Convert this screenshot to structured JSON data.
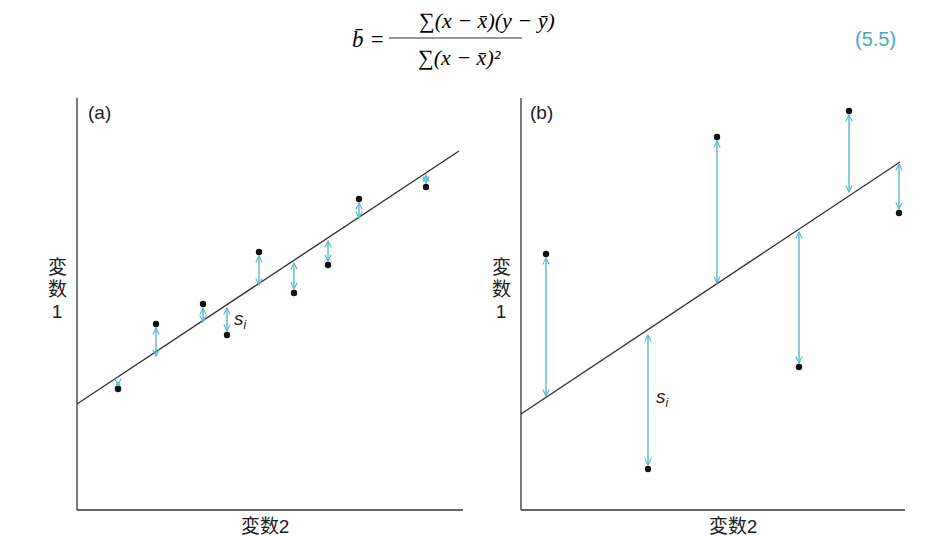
{
  "formula": {
    "lhs": "b̄ =",
    "numerator": "∑(x − x̄)(y − ȳ)",
    "denominator": "∑(x − x̄)²",
    "equation_number": "(5.5)",
    "equation_number_color": "#4aa8c0"
  },
  "colors": {
    "arrow": "#5bb7cc",
    "line": "#333333",
    "point": "#111111",
    "axis": "#333333"
  },
  "chart_data": [
    {
      "type": "scatter",
      "title": "(a)",
      "xlabel": "変数2",
      "ylabel": "変数1",
      "grid": false,
      "residual_label": "si",
      "note": "Small residuals: points lie close to the regression line",
      "points_px": [
        {
          "x": 118,
          "y": 389,
          "line_y": 381
        },
        {
          "x": 156,
          "y": 324,
          "line_y": 357
        },
        {
          "x": 203,
          "y": 304,
          "line_y": 323
        },
        {
          "x": 227,
          "y": 335,
          "line_y": 307
        },
        {
          "x": 259,
          "y": 252,
          "line_y": 286
        },
        {
          "x": 294,
          "y": 293,
          "line_y": 262
        },
        {
          "x": 328,
          "y": 265,
          "line_y": 240
        },
        {
          "x": 359,
          "y": 199,
          "line_y": 219
        },
        {
          "x": 426,
          "y": 187,
          "line_y": 174
        }
      ],
      "regression_line_px": {
        "x1": 77,
        "y1": 404,
        "x2": 459,
        "y2": 151
      }
    },
    {
      "type": "scatter",
      "title": "(b)",
      "xlabel": "変数2",
      "ylabel": "変数1",
      "grid": false,
      "residual_label": "si",
      "note": "Large residuals: points scattered far from the regression line",
      "points_px": [
        {
          "x": 546,
          "y": 254,
          "line_y": 397
        },
        {
          "x": 648,
          "y": 469,
          "line_y": 334
        },
        {
          "x": 717,
          "y": 137,
          "line_y": 284
        },
        {
          "x": 799,
          "y": 367,
          "line_y": 231
        },
        {
          "x": 849,
          "y": 111,
          "line_y": 193
        },
        {
          "x": 899,
          "y": 213,
          "line_y": 163
        }
      ],
      "regression_line_px": {
        "x1": 521,
        "y1": 414,
        "x2": 900,
        "y2": 162
      }
    }
  ],
  "panels": {
    "a": {
      "label": "(a)",
      "xlabel": "変数2",
      "ylabel_chars": [
        "変",
        "数",
        "1"
      ],
      "si": "s",
      "si_sub": "i"
    },
    "b": {
      "label": "(b)",
      "xlabel": "変数2",
      "ylabel_chars": [
        "変",
        "数",
        "1"
      ],
      "si": "s",
      "si_sub": "i"
    }
  }
}
